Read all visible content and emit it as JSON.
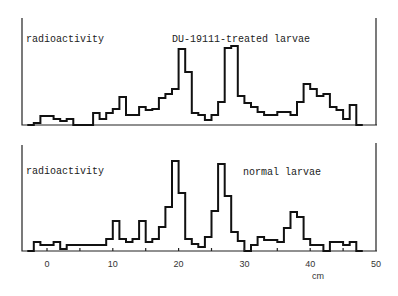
{
  "chart_data": [
    {
      "type": "line",
      "subtype": "step-histogram",
      "title": "DU-19111-treated larvae",
      "ylabel": "radioactivity",
      "xlabel": "cm",
      "xlim": [
        -4,
        50
      ],
      "grid": false,
      "x_bin_starts_cm": [
        -3,
        -2,
        -1,
        0,
        1,
        2,
        3,
        4,
        5,
        6,
        7,
        8,
        9,
        10,
        11,
        12,
        13,
        14,
        15,
        16,
        17,
        18,
        19,
        20,
        21,
        22,
        23,
        24,
        25,
        26,
        27,
        28,
        29,
        30,
        31,
        32,
        33,
        34,
        35,
        36,
        37,
        38,
        39,
        40,
        41,
        42,
        43,
        44,
        45,
        46,
        47
      ],
      "values": [
        0,
        2,
        9,
        9,
        6,
        4,
        6,
        0,
        0,
        0,
        12,
        6,
        12,
        16,
        28,
        10,
        10,
        18,
        15,
        16,
        27,
        31,
        36,
        76,
        53,
        12,
        10,
        5,
        10,
        23,
        77,
        79,
        29,
        22,
        18,
        13,
        10,
        10,
        13,
        13,
        10,
        23,
        41,
        36,
        29,
        31,
        18,
        15,
        6,
        20,
        0
      ],
      "annotations": [
        "radioactivity",
        "DU-19111-treated larvae"
      ]
    },
    {
      "type": "line",
      "subtype": "step-histogram",
      "title": "normal larvae",
      "ylabel": "radioactivity",
      "xlabel": "cm",
      "xlim": [
        -4,
        50
      ],
      "grid": false,
      "x_bin_starts_cm": [
        -3,
        -2,
        -1,
        0,
        1,
        2,
        3,
        4,
        5,
        6,
        7,
        8,
        9,
        10,
        11,
        12,
        13,
        14,
        15,
        16,
        17,
        18,
        19,
        20,
        21,
        22,
        23,
        24,
        25,
        26,
        27,
        28,
        29,
        30,
        31,
        32,
        33,
        34,
        35,
        36,
        37,
        38,
        39,
        40,
        41,
        42,
        43,
        44,
        45,
        46,
        47
      ],
      "values": [
        0,
        9,
        6,
        6,
        9,
        2,
        6,
        6,
        6,
        6,
        6,
        6,
        12,
        30,
        12,
        9,
        12,
        30,
        9,
        12,
        24,
        44,
        90,
        58,
        12,
        7,
        4,
        14,
        40,
        87,
        55,
        19,
        10,
        0,
        6,
        14,
        11,
        11,
        9,
        23,
        39,
        34,
        12,
        6,
        6,
        0,
        9,
        9,
        6,
        9,
        0
      ],
      "annotations": [
        "radioactivity",
        "normal larvae"
      ]
    }
  ],
  "x_axis": {
    "ticks": [
      0,
      10,
      20,
      30,
      40,
      50
    ],
    "tick_labels": [
      "0",
      "10",
      "20",
      "30",
      "40",
      "50"
    ],
    "unit_label": "cm"
  },
  "panels": {
    "top": {
      "ylabel": "radioactivity",
      "title": "DU-19111-treated larvae"
    },
    "bottom": {
      "ylabel": "radioactivity",
      "title": "normal larvae"
    }
  }
}
